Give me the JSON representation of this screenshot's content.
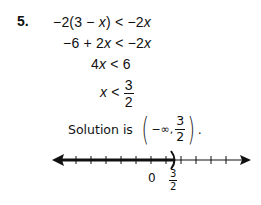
{
  "problem": {
    "number": "5.",
    "steps": [
      {
        "lhs": "−2(3 − ",
        "var": "x",
        "rhs_pre": ") < −2",
        "rhs_var": "x"
      },
      {
        "lhs": "−6 + 2",
        "var": "x",
        "rhs_pre": " < −2",
        "rhs_var": "x"
      },
      {
        "lhs": "4",
        "var": "x",
        "rhs_pre": " < 6",
        "rhs_var": ""
      }
    ],
    "final": {
      "var": "x",
      "relation": " < ",
      "numerator": "3",
      "denominator": "2"
    },
    "solution": {
      "label": "Solution is",
      "interval_left": "−∞,",
      "numerator": "3",
      "denominator": "2",
      "trailing": "."
    }
  },
  "number_line": {
    "zero_label": "0",
    "endpoint_numerator": "3",
    "endpoint_denominator": "2",
    "endpoint_symbol": ")",
    "shaded_direction": "left",
    "line_color": "#111111"
  }
}
